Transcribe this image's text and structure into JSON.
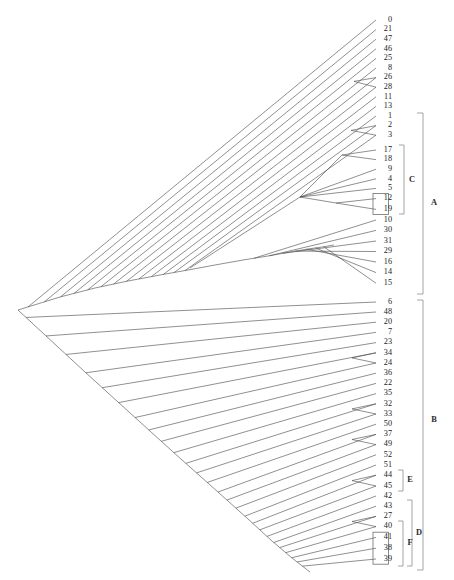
{
  "figure": {
    "type": "dendrogram",
    "orientation": "left-root-right-leaves",
    "background_color": "#ffffff",
    "edge_color": "#4a4a4a",
    "bracket_color": "#8e8e8e",
    "label_color": "#1b1b1b"
  },
  "leaves": [
    {
      "label": "0",
      "y": 20,
      "x_tip": 382,
      "boxed": false
    },
    {
      "label": "21",
      "y": 29.6,
      "x_tip": 382,
      "boxed": false
    },
    {
      "label": "47",
      "y": 39.2,
      "x_tip": 382,
      "boxed": false
    },
    {
      "label": "46",
      "y": 48.8,
      "x_tip": 382,
      "boxed": false
    },
    {
      "label": "25",
      "y": 58.4,
      "x_tip": 382,
      "boxed": false
    },
    {
      "label": "8",
      "y": 68.0,
      "x_tip": 382,
      "boxed": false
    },
    {
      "label": "26",
      "y": 77.6,
      "x_tip": 382,
      "boxed": false
    },
    {
      "label": "28",
      "y": 87.2,
      "x_tip": 382,
      "boxed": false
    },
    {
      "label": "11",
      "y": 96.8,
      "x_tip": 382,
      "boxed": false
    },
    {
      "label": "13",
      "y": 106.4,
      "x_tip": 382,
      "boxed": false
    },
    {
      "label": "1",
      "y": 116.0,
      "x_tip": 382,
      "boxed": false
    },
    {
      "label": "2",
      "y": 125.6,
      "x_tip": 382,
      "boxed": false
    },
    {
      "label": "3",
      "y": 135.2,
      "x_tip": 382,
      "boxed": false
    },
    {
      "label": "17",
      "y": 150.0,
      "x_tip": 382,
      "boxed": false
    },
    {
      "label": "18",
      "y": 159.6,
      "x_tip": 382,
      "boxed": false
    },
    {
      "label": "9",
      "y": 169.2,
      "x_tip": 382,
      "boxed": false
    },
    {
      "label": "4",
      "y": 178.8,
      "x_tip": 382,
      "boxed": false
    },
    {
      "label": "5",
      "y": 188.4,
      "x_tip": 382,
      "boxed": false
    },
    {
      "label": "12",
      "y": 198.6,
      "x_tip": 382,
      "boxed": true
    },
    {
      "label": "19",
      "y": 209.4,
      "x_tip": 382,
      "boxed": true
    },
    {
      "label": "10",
      "y": 220.0,
      "x_tip": 382,
      "boxed": false
    },
    {
      "label": "30",
      "y": 230.4,
      "x_tip": 382,
      "boxed": false
    },
    {
      "label": "31",
      "y": 241.0,
      "x_tip": 382,
      "boxed": false
    },
    {
      "label": "29",
      "y": 251.5,
      "x_tip": 382,
      "boxed": false
    },
    {
      "label": "16",
      "y": 262.0,
      "x_tip": 382,
      "boxed": false
    },
    {
      "label": "14",
      "y": 272.6,
      "x_tip": 382,
      "boxed": false
    },
    {
      "label": "15",
      "y": 283.2,
      "x_tip": 382,
      "boxed": false
    },
    {
      "label": "6",
      "y": 302.0,
      "x_tip": 382,
      "boxed": false
    },
    {
      "label": "48",
      "y": 312.0,
      "x_tip": 382,
      "boxed": false
    },
    {
      "label": "20",
      "y": 322.2,
      "x_tip": 382,
      "boxed": false
    },
    {
      "label": "7",
      "y": 332.4,
      "x_tip": 382,
      "boxed": false
    },
    {
      "label": "23",
      "y": 342.6,
      "x_tip": 382,
      "boxed": false
    },
    {
      "label": "34",
      "y": 352.8,
      "x_tip": 382,
      "boxed": false
    },
    {
      "label": "24",
      "y": 363.0,
      "x_tip": 382,
      "boxed": false
    },
    {
      "label": "36",
      "y": 373.2,
      "x_tip": 382,
      "boxed": false
    },
    {
      "label": "22",
      "y": 383.4,
      "x_tip": 382,
      "boxed": false
    },
    {
      "label": "35",
      "y": 393.6,
      "x_tip": 382,
      "boxed": false
    },
    {
      "label": "32",
      "y": 403.8,
      "x_tip": 382,
      "boxed": false
    },
    {
      "label": "33",
      "y": 414.0,
      "x_tip": 382,
      "boxed": false
    },
    {
      "label": "50",
      "y": 424.2,
      "x_tip": 382,
      "boxed": false
    },
    {
      "label": "37",
      "y": 434.4,
      "x_tip": 382,
      "boxed": false
    },
    {
      "label": "49",
      "y": 444.6,
      "x_tip": 382,
      "boxed": false
    },
    {
      "label": "52",
      "y": 454.8,
      "x_tip": 382,
      "boxed": false
    },
    {
      "label": "51",
      "y": 465.0,
      "x_tip": 382,
      "boxed": false
    },
    {
      "label": "44",
      "y": 475.2,
      "x_tip": 382,
      "boxed": false
    },
    {
      "label": "45",
      "y": 486.0,
      "x_tip": 382,
      "boxed": false
    },
    {
      "label": "42",
      "y": 496.0,
      "x_tip": 382,
      "boxed": false
    },
    {
      "label": "43",
      "y": 506.2,
      "x_tip": 382,
      "boxed": false
    },
    {
      "label": "27",
      "y": 516.4,
      "x_tip": 382,
      "boxed": false
    },
    {
      "label": "40",
      "y": 526.6,
      "x_tip": 382,
      "boxed": false
    },
    {
      "label": "41",
      "y": 537.4,
      "x_tip": 382,
      "boxed": true
    },
    {
      "label": "38",
      "y": 548.2,
      "x_tip": 382,
      "boxed": true
    },
    {
      "label": "39",
      "y": 559.0,
      "x_tip": 382,
      "boxed": true
    }
  ],
  "brackets": [
    {
      "id": "A",
      "label": "A",
      "x": 423,
      "y_top": 113,
      "y_bottom": 294,
      "tick": 6,
      "label_x": 434,
      "label_y": 203
    },
    {
      "id": "B",
      "label": "B",
      "x": 423,
      "y_top": 300,
      "y_bottom": 570,
      "tick": 6,
      "label_x": 434,
      "label_y": 420
    },
    {
      "id": "C",
      "label": "C",
      "x": 404,
      "y_top": 145,
      "y_bottom": 214,
      "tick": 5,
      "label_x": 412,
      "label_y": 180
    },
    {
      "id": "D",
      "label": "D",
      "x": 412,
      "y_top": 500,
      "y_bottom": 566,
      "tick": 5,
      "label_x": 419,
      "label_y": 533
    },
    {
      "id": "E",
      "label": "E",
      "x": 403,
      "y_top": 470,
      "y_bottom": 491,
      "tick": 5,
      "label_x": 410,
      "label_y": 480
    },
    {
      "id": "F",
      "label": "F",
      "x": 403,
      "y_top": 521,
      "y_bottom": 566,
      "tick": 5,
      "label_x": 410,
      "label_y": 543
    }
  ],
  "boxes": [
    {
      "x": 373.0,
      "y": 193.4,
      "width": 15.5,
      "height": 21.2,
      "leaves": [
        "12",
        "19"
      ]
    },
    {
      "x": 373.0,
      "y": 532.2,
      "width": 15.5,
      "height": 32.0,
      "leaves": [
        "41",
        "38",
        "39"
      ]
    }
  ],
  "tree": {
    "root": {
      "x": 18,
      "y": 310
    },
    "upper_spine": [
      {
        "x": 18,
        "y": 310
      },
      {
        "x": 60,
        "y": 297
      },
      {
        "x": 95,
        "y": 288
      },
      {
        "x": 128,
        "y": 281
      },
      {
        "x": 160,
        "y": 275
      },
      {
        "x": 188,
        "y": 270
      },
      {
        "x": 215,
        "y": 265
      },
      {
        "x": 243,
        "y": 260
      },
      {
        "x": 268,
        "y": 256
      },
      {
        "x": 290,
        "y": 252
      },
      {
        "x": 308,
        "y": 249
      },
      {
        "x": 322,
        "y": 247
      },
      {
        "x": 334,
        "y": 245
      }
    ],
    "lower_spine": [
      {
        "x": 18,
        "y": 310
      },
      {
        "x": 85,
        "y": 372
      },
      {
        "x": 140,
        "y": 422
      },
      {
        "x": 182,
        "y": 460
      },
      {
        "x": 218,
        "y": 492
      },
      {
        "x": 248,
        "y": 519
      },
      {
        "x": 272,
        "y": 541
      },
      {
        "x": 292,
        "y": 558
      },
      {
        "x": 310,
        "y": 572
      }
    ]
  }
}
